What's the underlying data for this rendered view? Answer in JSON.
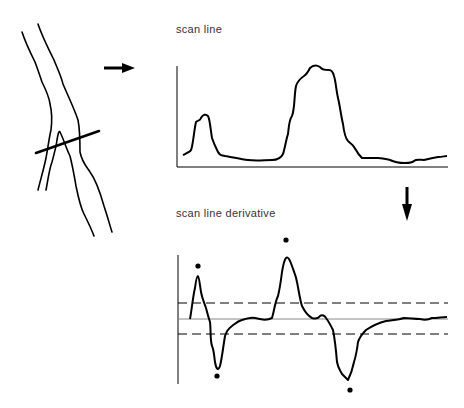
{
  "labels": {
    "scan_line": "scan line",
    "scan_line_derivative": "scan line derivative"
  },
  "colors": {
    "ink": "#000000",
    "text": "#333333",
    "baseline": "#888888",
    "background": "#ffffff"
  },
  "diagram": {
    "panels": [
      {
        "name": "vessel-sketch",
        "description": "Two-branch vessel outline with a thick scan line crossing it"
      },
      {
        "name": "scan-line-profile",
        "description": "Intensity profile along the scan line: small peak then large plateau peak"
      },
      {
        "name": "scan-line-derivative",
        "description": "Derivative of profile with dashed threshold lines; extrema marked with dots"
      }
    ],
    "arrows": [
      {
        "name": "right-arrow",
        "from": "vessel-sketch",
        "to": "scan-line-profile"
      },
      {
        "name": "down-arrow",
        "from": "scan-line-profile",
        "to": "scan-line-derivative"
      }
    ],
    "extrema_markers": [
      {
        "type": "max",
        "x": 198,
        "y": 266
      },
      {
        "type": "min",
        "x": 217,
        "y": 376
      },
      {
        "type": "max",
        "x": 286,
        "y": 240
      },
      {
        "type": "min",
        "x": 350,
        "y": 390
      }
    ]
  }
}
